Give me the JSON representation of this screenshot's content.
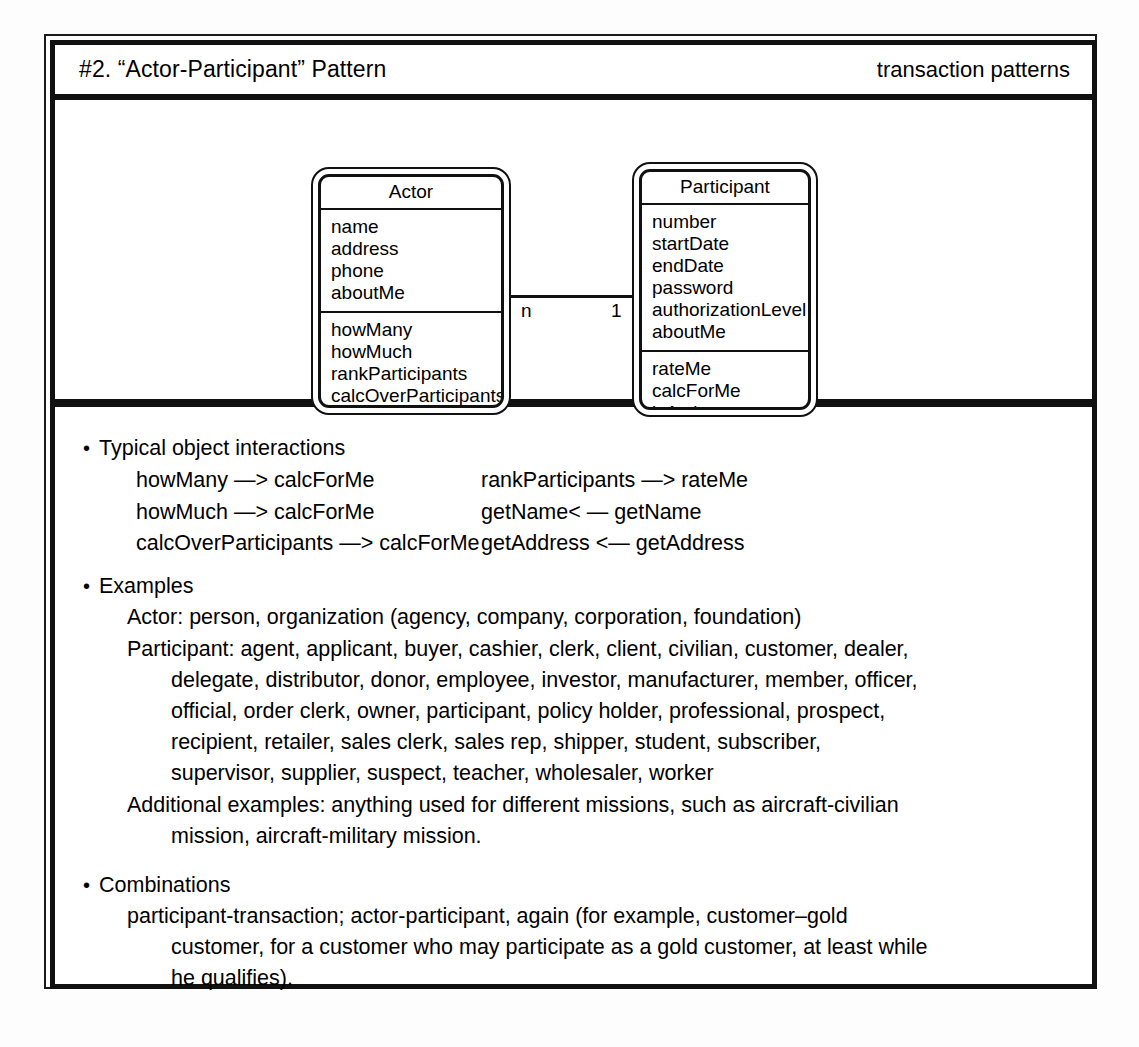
{
  "header": {
    "title": "#2. “Actor-Participant” Pattern",
    "category": "transaction patterns"
  },
  "diagram": {
    "type": "uml-class-diagram",
    "classes": [
      {
        "name": "Actor",
        "attributes": [
          "name",
          "address",
          "phone",
          "aboutMe"
        ],
        "operations": [
          "howMany",
          "howMuch",
          "rankParticipants",
          "calcOverParticipants",
          "calcForMe"
        ]
      },
      {
        "name": "Participant",
        "attributes": [
          "number",
          "startDate",
          "endDate",
          "password",
          "authorizationLevel",
          "aboutMe"
        ],
        "operations": [
          "rateMe",
          "calcForMe",
          "isActive"
        ]
      }
    ],
    "association": {
      "source_multiplicity": "n",
      "target_multiplicity": "1"
    }
  },
  "sections": {
    "interactions": {
      "heading": "Typical object interactions",
      "left": [
        "howMany —> calcForMe",
        "howMuch —> calcForMe",
        "calcOverParticipants —> calcForMe"
      ],
      "right": [
        "rankParticipants —> rateMe",
        "getName< — getName",
        "getAddress <— getAddress"
      ]
    },
    "examples": {
      "heading": "Examples",
      "actor_line": "Actor: person, organization (agency, company, corporation, foundation)",
      "participant_lines": [
        "Participant: agent, applicant, buyer, cashier, clerk, client, civilian, customer, dealer,",
        "delegate, distributor, donor, employee, investor, manufacturer, member, officer,",
        "official, order clerk, owner, participant, policy holder, professional, prospect,",
        "recipient, retailer, sales clerk, sales rep, shipper, student, subscriber,",
        "supervisor, supplier, suspect, teacher, wholesaler, worker"
      ],
      "additional_lines": [
        "Additional examples: anything used for different missions, such as aircraft-civilian",
        "mission, aircraft-military mission."
      ]
    },
    "combinations": {
      "heading": "Combinations",
      "lines": [
        "participant-transaction; actor-participant, again (for example, customer–gold",
        "customer, for a customer who may participate as a gold customer, at least while",
        "he qualifies)."
      ]
    }
  },
  "glyphs": {
    "bullet": "•"
  }
}
